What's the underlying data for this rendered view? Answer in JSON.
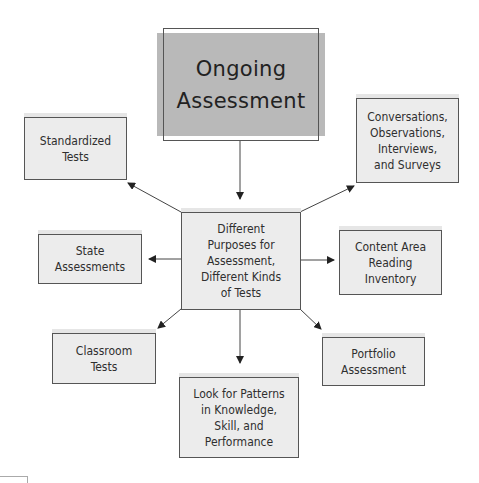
{
  "diagram": {
    "title": "Ongoing Assessment",
    "title_lines": "Ongoing\nAssessment",
    "center": {
      "label": "Different\nPurposes for\nAssessment,\nDifferent Kinds\nof Tests"
    },
    "nodes": [
      {
        "id": "standardized-tests",
        "label": "Standardized\nTests"
      },
      {
        "id": "conversations",
        "label": "Conversations,\nObservations,\nInterviews,\nand Surveys"
      },
      {
        "id": "state-assessments",
        "label": "State\nAssessments"
      },
      {
        "id": "content-area",
        "label": "Content Area\nReading\nInventory"
      },
      {
        "id": "classroom-tests",
        "label": "Classroom\nTests"
      },
      {
        "id": "portfolio",
        "label": "Portfolio\nAssessment"
      },
      {
        "id": "patterns",
        "label": "Look for Patterns\nin Knowledge,\nSkill, and\nPerformance"
      }
    ],
    "edges": [
      {
        "from": "Ongoing Assessment",
        "to": "Different Purposes for Assessment, Different Kinds of Tests"
      },
      {
        "from": "center",
        "to": "Standardized Tests"
      },
      {
        "from": "center",
        "to": "Conversations, Observations, Interviews, and Surveys"
      },
      {
        "from": "center",
        "to": "State Assessments"
      },
      {
        "from": "center",
        "to": "Content Area Reading Inventory"
      },
      {
        "from": "center",
        "to": "Classroom Tests"
      },
      {
        "from": "center",
        "to": "Portfolio Assessment"
      },
      {
        "from": "center",
        "to": "Look for Patterns in Knowledge, Skill, and Performance"
      }
    ],
    "colors": {
      "title_fill": "#b9b9b9",
      "box_fill": "#ececec",
      "border": "#555555",
      "arrow": "#333333"
    }
  }
}
